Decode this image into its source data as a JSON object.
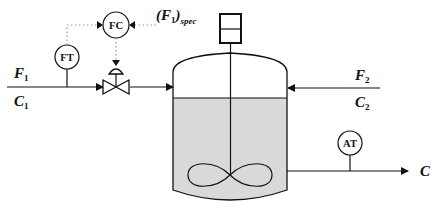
{
  "diagram": {
    "streams": {
      "feed1": {
        "flow": "F",
        "flow_sub": "1",
        "conc": "C",
        "conc_sub": "1"
      },
      "feed2": {
        "flow": "F",
        "flow_sub": "2",
        "conc": "C",
        "conc_sub": "2"
      },
      "outlet": {
        "conc": "C"
      }
    },
    "instruments": {
      "flow_transmitter": "FT",
      "flow_controller": "FC",
      "analyzer_transmitter": "AT"
    },
    "setpoint": {
      "open": "(",
      "var": "F",
      "var_sub": "1",
      "close": ")",
      "sub": "spec"
    },
    "colors": {
      "line": "#111111",
      "liquid": "#d9d9d9",
      "signal": "#9a9a9a"
    }
  }
}
